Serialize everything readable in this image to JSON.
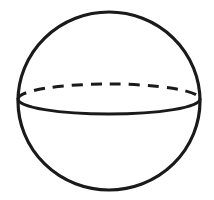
{
  "figure": {
    "name": "sphere",
    "background_color": "#ffffff",
    "stroke_color": "#1a1a1a",
    "canvas": {
      "width": 214,
      "height": 200
    },
    "shapes": {
      "sphere_outline": {
        "type": "circle",
        "center_x": 109,
        "center_y": 101,
        "radius_x": 91,
        "radius_y": 89,
        "stroke_width": 3.2,
        "style": "solid"
      },
      "equator_back": {
        "type": "ellipse-arc-upper",
        "center_x": 109,
        "center_y": 99,
        "radius_x": 91,
        "radius_y": 15,
        "stroke_width": 3.0,
        "style": "dashed",
        "dash_length": 11,
        "dash_gap": 8,
        "dash_count": 12,
        "visibility": "hidden-behind"
      },
      "equator_front": {
        "type": "ellipse-arc-lower",
        "center_x": 109,
        "center_y": 99,
        "radius_x": 91,
        "radius_y": 15,
        "stroke_width": 3.0,
        "style": "solid",
        "visibility": "visible-front"
      }
    }
  }
}
